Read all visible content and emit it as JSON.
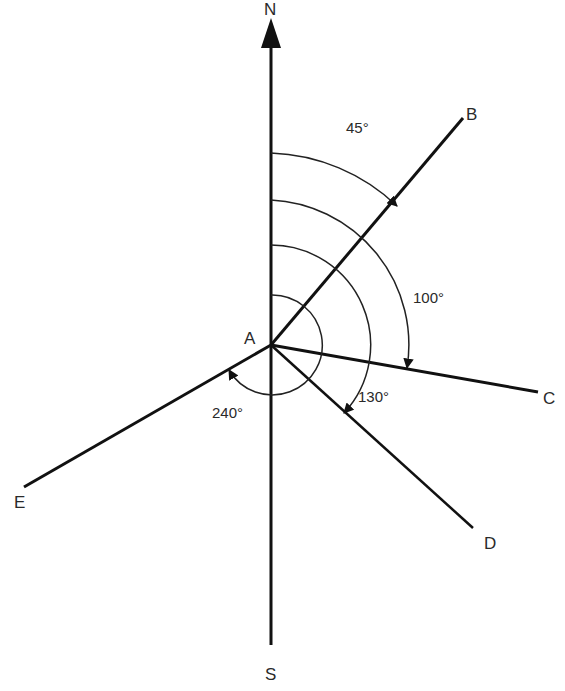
{
  "diagram": {
    "center": {
      "label": "A",
      "x": 271,
      "y": 345
    },
    "compass": {
      "north": {
        "label": "N",
        "x": 271,
        "y": 15
      },
      "south": {
        "label": "S",
        "x": 271,
        "y": 645
      }
    },
    "lines": [
      {
        "label": "B",
        "bearing_deg": 45,
        "x2": 463,
        "y2": 118,
        "lx": 466,
        "ly": 120
      },
      {
        "label": "C",
        "bearing_deg": 100,
        "x2": 538,
        "y2": 392,
        "lx": 543,
        "ly": 404
      },
      {
        "label": "D",
        "bearing_deg": 130,
        "x2": 473,
        "y2": 528,
        "lx": 484,
        "ly": 549
      },
      {
        "label": "E",
        "bearing_deg": 240,
        "x2": 24,
        "y2": 487,
        "lx": 14,
        "ly": 508
      }
    ],
    "angles": [
      {
        "label": "45°",
        "radius": 192,
        "to_deg": 45,
        "lx": 346,
        "ly": 133
      },
      {
        "label": "100°",
        "radius": 145,
        "to_deg": 100,
        "lx": 413,
        "ly": 303
      },
      {
        "label": "130°",
        "radius": 100,
        "to_deg": 130,
        "lx": 358,
        "ly": 402
      },
      {
        "label": "240°",
        "radius": 50,
        "to_deg": 240,
        "lx": 212,
        "ly": 418
      }
    ],
    "colors": {
      "line": "#111111",
      "text": "#2a2a2a",
      "background": "#ffffff"
    }
  }
}
